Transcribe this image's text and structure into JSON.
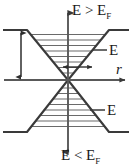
{
  "figure": {
    "type": "band-bending-diagram",
    "background_color": "#ffffff",
    "line_color": "#3a3a3a",
    "text_color": "#1a1a1a"
  },
  "labels": {
    "top_region": {
      "text": "E > E",
      "subscript": "F",
      "full": "E > E_F",
      "meaning": "energy above Fermi level"
    },
    "bottom_region": {
      "text": "E < E",
      "subscript": "F",
      "full": "E < E_F",
      "meaning": "energy below Fermi level"
    },
    "upper_band": {
      "text": "E",
      "subscript": "+",
      "full": "E",
      "meaning": "upper band branch label"
    },
    "lower_band": {
      "text": "E",
      "subscript": "-",
      "full": "E",
      "meaning": "lower band branch label"
    },
    "horizontal_axis": {
      "text": "r",
      "meaning": "radial coordinate axis"
    },
    "vertical_axis": {
      "text": "E",
      "meaning": "energy axis"
    }
  },
  "axes": {
    "vertical": {
      "name": "energy-axis",
      "orientation": "vertical",
      "x": 68,
      "y_top": 10,
      "y_bottom": 155,
      "arrowheads": [
        "top",
        "bottom"
      ]
    },
    "horizontal": {
      "name": "r-axis",
      "orientation": "horizontal",
      "y": 80,
      "x_left": 4,
      "x_right": 128,
      "arrowheads": [
        "right"
      ]
    }
  },
  "annotations": {
    "gap_arrow": {
      "name": "band-gap-arrow",
      "orientation": "vertical",
      "double_headed": true,
      "x": 21,
      "y_top": 30,
      "y_bottom": 79,
      "meaning": "band edge to Fermi level separation"
    },
    "radial_arrow": {
      "name": "radial-extent-arrow",
      "orientation": "horizontal",
      "double_headed": true,
      "y": 67,
      "x_left": 62,
      "x_right": 93,
      "meaning": "radial spread near crossing point"
    }
  },
  "geometry": {
    "crossing_point": {
      "x": 68,
      "y": 80
    },
    "upper_funnel": {
      "shape": "V",
      "left_outer_x": 4,
      "right_outer_x": 128,
      "left_shoulder_x": 27,
      "right_shoulder_x": 109,
      "top_y": 30,
      "apex_y": 80,
      "hatch_lines": 8
    },
    "lower_funnel": {
      "shape": "inverted-V",
      "left_outer_x": 4,
      "right_outer_x": 128,
      "left_shoulder_x": 27,
      "right_shoulder_x": 109,
      "bottom_y": 132,
      "apex_y": 80,
      "hatch_lines": 8
    }
  }
}
